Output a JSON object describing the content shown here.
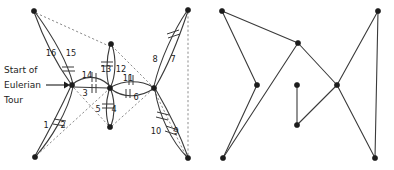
{
  "figure": {
    "background_color": "#ffffff",
    "edge_color": "#3a3a3a",
    "dashed_edge_color": "#8d8d8d",
    "vertex_color": "#1c1c1c",
    "label_color": "#1c1c1c"
  },
  "caption": {
    "line1": "Start of",
    "line2": "Eulerian",
    "line3": "Tour",
    "arrow": "arrow-right"
  },
  "left_panel": {
    "name": "eulerian-tour-graph",
    "vertices": [
      {
        "id": "v-top-left",
        "x": 34,
        "y": 11
      },
      {
        "id": "v-hub-left",
        "x": 72,
        "y": 85
      },
      {
        "id": "v-bottom-left",
        "x": 35,
        "y": 157
      },
      {
        "id": "v-top-mid",
        "x": 111,
        "y": 44
      },
      {
        "id": "v-hub-center",
        "x": 110,
        "y": 88
      },
      {
        "id": "v-bottom-mid",
        "x": 110,
        "y": 127
      },
      {
        "id": "v-hub-right",
        "x": 154,
        "y": 88
      },
      {
        "id": "v-top-right",
        "x": 188,
        "y": 10
      },
      {
        "id": "v-bottom-right",
        "x": 188,
        "y": 158
      }
    ],
    "edge_labels": [
      {
        "n": "1",
        "x": 46,
        "y": 128
      },
      {
        "n": "2",
        "x": 63,
        "y": 128
      },
      {
        "n": "3",
        "x": 85,
        "y": 96
      },
      {
        "n": "4",
        "x": 114,
        "y": 112
      },
      {
        "n": "5",
        "x": 98,
        "y": 112
      },
      {
        "n": "6",
        "x": 136,
        "y": 100
      },
      {
        "n": "7",
        "x": 173,
        "y": 62
      },
      {
        "n": "8",
        "x": 155,
        "y": 62
      },
      {
        "n": "9",
        "x": 176,
        "y": 134
      },
      {
        "n": "10",
        "x": 156,
        "y": 134
      },
      {
        "n": "11",
        "x": 128,
        "y": 81
      },
      {
        "n": "12",
        "x": 121,
        "y": 72
      },
      {
        "n": "13",
        "x": 106,
        "y": 72
      },
      {
        "n": "14",
        "x": 87,
        "y": 78
      },
      {
        "n": "15",
        "x": 71,
        "y": 56
      },
      {
        "n": "16",
        "x": 51,
        "y": 56
      }
    ]
  },
  "right_panel": {
    "name": "straight-line-redraw-graph",
    "vertices": [
      {
        "id": "r-top-left",
        "x": 222,
        "y": 11
      },
      {
        "id": "r-top-mid",
        "x": 298,
        "y": 43
      },
      {
        "id": "r-top-right",
        "x": 378,
        "y": 11
      },
      {
        "id": "r-mid-left",
        "x": 257,
        "y": 85
      },
      {
        "id": "r-mid-center",
        "x": 297,
        "y": 85
      },
      {
        "id": "r-mid-right",
        "x": 337,
        "y": 85
      },
      {
        "id": "r-bottom-left",
        "x": 223,
        "y": 158
      },
      {
        "id": "r-bottom-mid",
        "x": 297,
        "y": 125
      },
      {
        "id": "r-bottom-right",
        "x": 375,
        "y": 158
      }
    ],
    "edges": [
      {
        "from": "r-top-left",
        "to": "r-top-mid"
      },
      {
        "from": "r-top-left",
        "to": "r-mid-left"
      },
      {
        "from": "r-mid-left",
        "to": "r-bottom-left"
      },
      {
        "from": "r-bottom-left",
        "to": "r-top-mid"
      },
      {
        "from": "r-top-mid",
        "to": "r-mid-right"
      },
      {
        "from": "r-mid-right",
        "to": "r-top-right"
      },
      {
        "from": "r-top-right",
        "to": "r-bottom-right"
      },
      {
        "from": "r-mid-right",
        "to": "r-bottom-right"
      },
      {
        "from": "r-mid-center",
        "to": "r-bottom-mid"
      }
    ]
  }
}
